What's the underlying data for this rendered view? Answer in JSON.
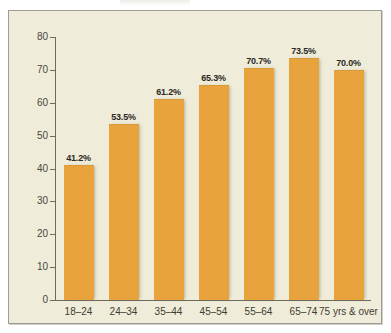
{
  "figure": {
    "background_color": "#ffffff",
    "panel_color": "#efecd9",
    "frame_border_color": "#9e9c92",
    "bar_color": "#e8a33c",
    "axis_color": "#6e6a5c",
    "text_color": "#3f3c35"
  },
  "chart_data": {
    "type": "bar",
    "title": "",
    "subtitle": "",
    "xlabel": "",
    "ylabel": "",
    "categories": [
      "18–24",
      "24–34",
      "35–44",
      "45–54",
      "55–64",
      "65–74",
      "75 yrs & over"
    ],
    "values": [
      41.2,
      53.5,
      61.2,
      65.3,
      70.7,
      73.5,
      70.0
    ],
    "data_labels": [
      "41.2%",
      "53.5%",
      "61.2%",
      "65.3%",
      "70.7%",
      "73.5%",
      "70.0%"
    ],
    "ylim": [
      0,
      80
    ],
    "yticks": [
      0,
      10,
      20,
      30,
      40,
      50,
      60,
      70,
      80
    ],
    "ytick_labels": [
      "0",
      "10",
      "20",
      "30",
      "40",
      "50",
      "60",
      "70",
      "80"
    ],
    "grid": false,
    "legend": null,
    "legend_position": "none",
    "series": [
      {
        "name": "",
        "values": [
          41.2,
          53.5,
          61.2,
          65.3,
          70.7,
          73.5,
          70.0
        ]
      }
    ]
  }
}
